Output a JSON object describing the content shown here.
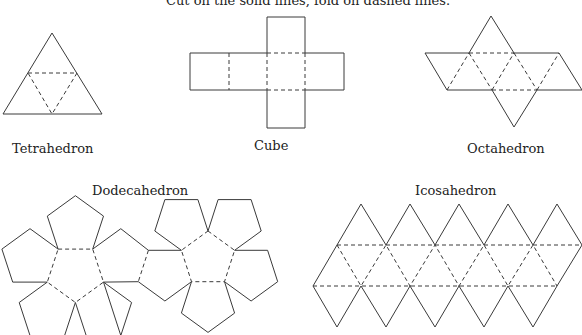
{
  "header": {
    "instruction": "Cut on the solid lines, fold on dashed lines."
  },
  "nets": [
    {
      "id": "tetrahedron",
      "label": "Tetrahedron"
    },
    {
      "id": "cube",
      "label": "Cube"
    },
    {
      "id": "octahedron",
      "label": "Octahedron"
    },
    {
      "id": "dodecahedron",
      "label": "Dodecahedron"
    },
    {
      "id": "icosahedron",
      "label": "Icosahedron"
    }
  ],
  "colors": {
    "line": "#3a3a3a",
    "background": "#ffffff",
    "text": "#222222"
  },
  "legend": {
    "solid_line_meaning": "cut",
    "dashed_line_meaning": "fold"
  }
}
